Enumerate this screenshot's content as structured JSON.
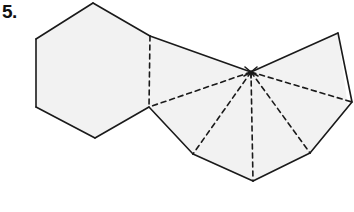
{
  "figure": {
    "problem_number": "5.",
    "canvas": {
      "width": 354,
      "height": 212
    },
    "colors": {
      "background": "#ffffff",
      "face_fill": "#f2f2f2",
      "solid_edge": "#1a1a1a",
      "fold_line": "#1a1a1a",
      "label_text": "#111111"
    },
    "style": {
      "solid_stroke_width": 1.6,
      "fold_stroke_width": 1.6,
      "fold_dash_pattern": "5,4"
    },
    "apex_point": {
      "name": "fan-apex",
      "x": 251,
      "y": 72
    },
    "faces": [
      {
        "name": "hexagon-face",
        "kind": "hexagon",
        "points": "93,3 150,36 149,107 95,138 36,107 36,39"
      },
      {
        "name": "upper-quad-face",
        "kind": "quadrilateral",
        "points": "150,36 251,72 149,107"
      },
      {
        "name": "fan-face-group",
        "kind": "fan-polygon",
        "points": "251,72 149,107 193,154 253,181 310,153 348,108 338,33"
      }
    ],
    "solid_edges": [
      {
        "name": "hexagon-edge-top-left",
        "x1": 36,
        "y1": 39,
        "x2": 93,
        "y2": 3
      },
      {
        "name": "hexagon-edge-top-right",
        "x1": 93,
        "y1": 3,
        "x2": 150,
        "y2": 36
      },
      {
        "name": "hexagon-edge-left",
        "x1": 36,
        "y1": 39,
        "x2": 36,
        "y2": 107
      },
      {
        "name": "hexagon-edge-bottom-left",
        "x1": 36,
        "y1": 107,
        "x2": 95,
        "y2": 138
      },
      {
        "name": "hexagon-edge-bottom-right",
        "x1": 95,
        "y1": 138,
        "x2": 149,
        "y2": 107
      },
      {
        "name": "top-ridge-to-apex",
        "x1": 150,
        "y1": 36,
        "x2": 251,
        "y2": 72
      },
      {
        "name": "apex-to-top-right-corner",
        "x1": 251,
        "y1": 72,
        "x2": 338,
        "y2": 33
      },
      {
        "name": "right-upper-edge",
        "x1": 338,
        "y1": 33,
        "x2": 352,
        "y2": 102
      },
      {
        "name": "right-lower-edge",
        "x1": 352,
        "y1": 102,
        "x2": 310,
        "y2": 153
      },
      {
        "name": "bottom-right-edge",
        "x1": 310,
        "y1": 153,
        "x2": 253,
        "y2": 181
      },
      {
        "name": "bottom-left-edge",
        "x1": 253,
        "y1": 181,
        "x2": 193,
        "y2": 154
      },
      {
        "name": "lower-left-edge",
        "x1": 193,
        "y1": 154,
        "x2": 149,
        "y2": 107
      }
    ],
    "fold_lines": [
      {
        "name": "fold-hexagon-right-edge",
        "x1": 150,
        "y1": 36,
        "x2": 149,
        "y2": 107
      },
      {
        "name": "fold-apex-to-notch",
        "x1": 251,
        "y1": 72,
        "x2": 149,
        "y2": 107
      },
      {
        "name": "fold-apex-to-lower-left",
        "x1": 251,
        "y1": 72,
        "x2": 193,
        "y2": 154
      },
      {
        "name": "fold-apex-to-bottom",
        "x1": 251,
        "y1": 72,
        "x2": 253,
        "y2": 181
      },
      {
        "name": "fold-apex-to-bottom-right",
        "x1": 251,
        "y1": 72,
        "x2": 310,
        "y2": 153
      },
      {
        "name": "fold-apex-to-right",
        "x1": 251,
        "y1": 72,
        "x2": 352,
        "y2": 102
      }
    ],
    "apex_burst_rays": [
      {
        "name": "burst-ray-1",
        "x1": 251,
        "y1": 72,
        "x2": 245,
        "y2": 67
      },
      {
        "name": "burst-ray-2",
        "x1": 251,
        "y1": 72,
        "x2": 257,
        "y2": 67
      },
      {
        "name": "burst-ray-3",
        "x1": 251,
        "y1": 72,
        "x2": 244,
        "y2": 76
      },
      {
        "name": "burst-ray-4",
        "x1": 251,
        "y1": 72,
        "x2": 258,
        "y2": 76
      },
      {
        "name": "burst-ray-5",
        "x1": 251,
        "y1": 72,
        "x2": 251,
        "y2": 78
      }
    ]
  }
}
